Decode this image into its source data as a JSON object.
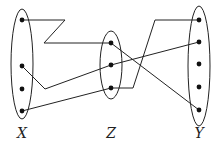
{
  "diagram": {
    "sets": [
      {
        "id": "X",
        "label": "X",
        "cx": 22,
        "cy": 64,
        "rx": 11,
        "ry": 55,
        "label_y": 138,
        "points": [
          {
            "x": 22,
            "y": 20
          },
          {
            "x": 22,
            "y": 66
          },
          {
            "x": 22,
            "y": 89
          },
          {
            "x": 22,
            "y": 111
          }
        ]
      },
      {
        "id": "Z",
        "label": "Z",
        "cx": 111,
        "cy": 65,
        "rx": 11,
        "ry": 34,
        "label_y": 138,
        "points": [
          {
            "x": 111,
            "y": 43
          },
          {
            "x": 111,
            "y": 65
          },
          {
            "x": 111,
            "y": 88
          }
        ]
      },
      {
        "id": "Y",
        "label": "Y",
        "cx": 199,
        "cy": 66,
        "rx": 11,
        "ry": 60,
        "label_y": 138,
        "points": [
          {
            "x": 199,
            "y": 20
          },
          {
            "x": 199,
            "y": 42
          },
          {
            "x": 199,
            "y": 64
          },
          {
            "x": 199,
            "y": 87
          },
          {
            "x": 199,
            "y": 110
          }
        ]
      }
    ],
    "edges": [
      {
        "from": "X1",
        "to": "Z1",
        "path": "22,20 65,20 44,43 111,43"
      },
      {
        "from": "X2",
        "to": "Z2",
        "path": "22,66 45,89 111,65"
      },
      {
        "from": "X4",
        "to": "Z3",
        "path": "22,111 111,88"
      },
      {
        "from": "Z1",
        "to": "Y5",
        "path": "111,43 199,110"
      },
      {
        "from": "Z2",
        "to": "Y2",
        "path": "111,65 199,42"
      },
      {
        "from": "Z3",
        "to": "Y1",
        "path": "111,88 133,88 155,20 199,20"
      }
    ],
    "colors": {
      "stroke": "#222222",
      "point": "#111111"
    }
  }
}
